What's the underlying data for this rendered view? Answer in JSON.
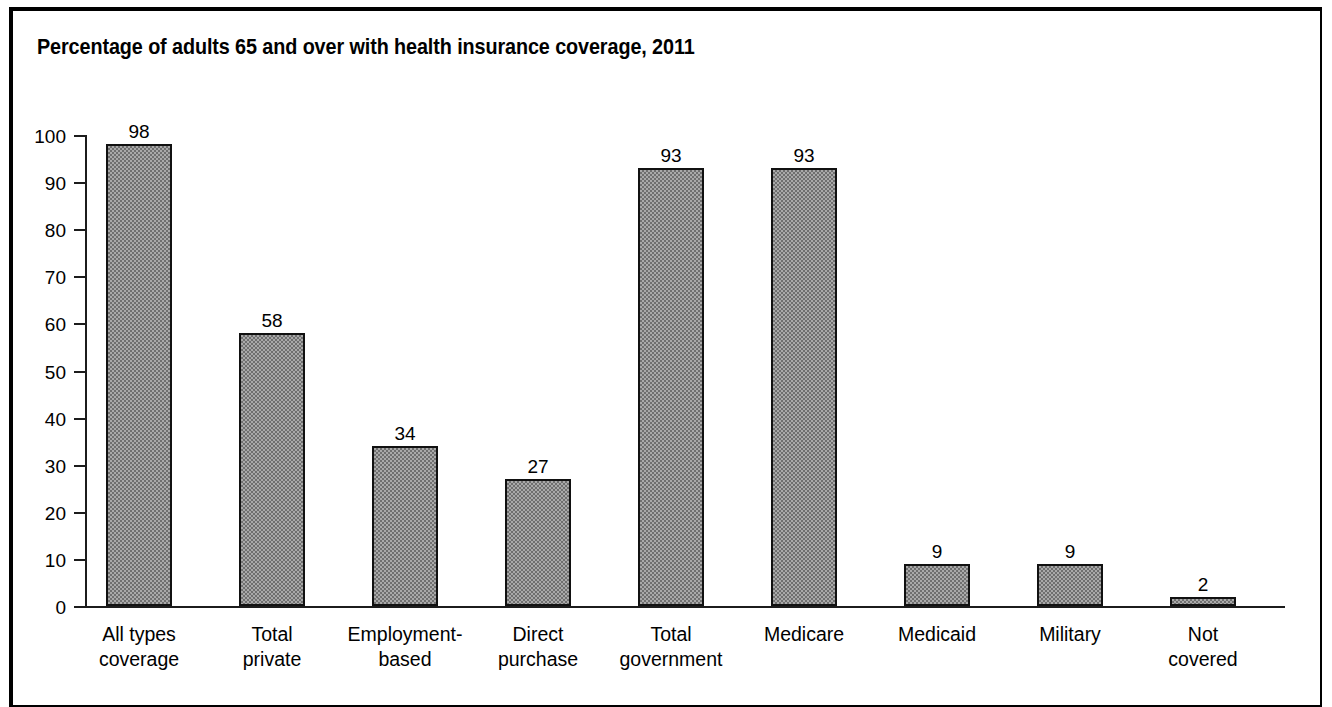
{
  "chart_data": {
    "type": "bar",
    "title": "Percentage of adults 65 and over with health insurance coverage, 2011",
    "xlabel": "",
    "ylabel": "",
    "ylim": [
      0,
      100
    ],
    "yticks": [
      0,
      10,
      20,
      30,
      40,
      50,
      60,
      70,
      80,
      90,
      100
    ],
    "ytick_labels": [
      "0",
      "10",
      "20",
      "30",
      "40",
      "50",
      "60",
      "70",
      "80",
      "90",
      "100"
    ],
    "grid": false,
    "legend": "none",
    "bar_fill": "#a9a9a9",
    "bar_edge": "#111111",
    "categories": [
      "All types\ncoverage",
      "Total\nprivate",
      "Employment-\nbased",
      "Direct\npurchase",
      "Total\ngovernment",
      "Medicare",
      "Medicaid",
      "Military",
      "Not\ncovered"
    ],
    "values": [
      98,
      58,
      34,
      27,
      93,
      93,
      9,
      9,
      2
    ],
    "value_labels": [
      "98",
      "58",
      "34",
      "27",
      "93",
      "93",
      "9",
      "9",
      "2"
    ]
  }
}
